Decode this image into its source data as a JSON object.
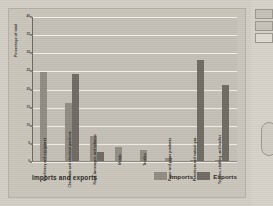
{
  "figure": {
    "xlabel": "Imports and exports",
    "legend": [
      {
        "label": "Imports",
        "color": "#908c83"
      },
      {
        "label": "Exports",
        "color": "#6f6b63"
      }
    ]
  },
  "chart_data": {
    "type": "bar",
    "title": "",
    "xlabel": "Imports and exports",
    "ylabel": "Percentage of total",
    "ylim": [
      0,
      40
    ],
    "yticks": [
      0,
      5,
      10,
      15,
      20,
      25,
      30,
      35,
      40
    ],
    "ytick_labels": [
      "0",
      "5",
      "10",
      "15",
      "20",
      "25",
      "30",
      "35",
      "40"
    ],
    "grid": true,
    "legend_position": "bottom-right",
    "categories": [
      "Machinery and equipment",
      "Chemicals and chemical products",
      "Food, beverages, and tobacco",
      "Metals",
      "Textiles",
      "Paper and paper products",
      "Petroleum and natural gas",
      "Textiles, clothing, and leather"
    ],
    "series": [
      {
        "name": "Imports",
        "color": "#908c83",
        "values": [
          24.5,
          16.0,
          7.0,
          4.0,
          3.0,
          0.8,
          0.4,
          0.3
        ]
      },
      {
        "name": "Exports",
        "color": "#6f6b63",
        "values": [
          0.0,
          24.0,
          2.5,
          0.0,
          0.0,
          0.0,
          28.0,
          21.0
        ]
      }
    ]
  },
  "side_panel": {
    "boxes": [
      "panel-item-1",
      "panel-item-2",
      "panel-item-3"
    ],
    "rounded_control": "rounded-control"
  }
}
